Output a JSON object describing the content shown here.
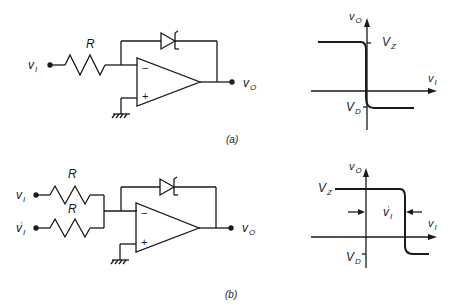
{
  "figure": {
    "panels": [
      {
        "id": "a",
        "caption": "(a)",
        "circuit": {
          "input_label": "v",
          "input_sub": "I",
          "resistor_label": "R",
          "output_label": "v",
          "output_sub": "O",
          "opamp_minus": "−",
          "opamp_plus": "+",
          "feedback_element": "zener-diode"
        },
        "transfer": {
          "y_axis_label": "v",
          "y_axis_sub": "O",
          "x_axis_label": "v",
          "x_axis_sub": "I",
          "high_level_label": "V",
          "high_level_sub": "Z",
          "low_level_label": "V",
          "low_level_sub": "D"
        }
      },
      {
        "id": "b",
        "caption": "(b)",
        "circuit": {
          "input1_label": "v",
          "input1_sub": "I",
          "input2_label": "v",
          "input2_sub": "I",
          "input2_prime": "'",
          "resistor1_label": "R",
          "resistor2_label": "R",
          "output_label": "v",
          "output_sub": "O",
          "opamp_minus": "−",
          "opamp_plus": "+",
          "feedback_element": "zener-diode"
        },
        "transfer": {
          "y_axis_label": "v",
          "y_axis_sub": "O",
          "x_axis_label": "v",
          "x_axis_sub": "I",
          "high_level_label": "V",
          "high_level_sub": "Z",
          "low_level_label": "V",
          "low_level_sub": "D",
          "offset_label": "v",
          "offset_sub": "I",
          "offset_prime": "'"
        }
      }
    ]
  }
}
